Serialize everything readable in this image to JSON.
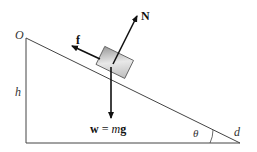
{
  "diagram": {
    "labels": {
      "origin": "O",
      "height": "h",
      "distance": "d",
      "angle": "θ",
      "normal_force": "N",
      "friction": "f",
      "weight_w": "w",
      "weight_eq": " = ",
      "weight_m": "m",
      "weight_g": "g"
    },
    "colors": {
      "line": "#222222",
      "block_light": "#e6e6e6",
      "block_dark": "#9a9a9a"
    }
  }
}
